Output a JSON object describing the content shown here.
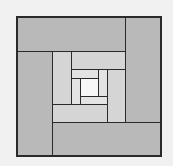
{
  "diagram": {
    "type": "log-cabin spiral of nested rectangles",
    "colors": {
      "background": "#f1f1f1",
      "stroke": "#2a2a2a",
      "ring_outer": "#b9b9b9",
      "ring_middle": "#d5d5d5",
      "ring_inner": "#e3e3e3",
      "center": "#f7f7f7"
    },
    "frame": {
      "x": 16,
      "y": 16,
      "w": 146,
      "h": 141
    },
    "rects": [
      {
        "name": "outer-top",
        "ring": "outer",
        "x": 16,
        "y": 16,
        "w": 110,
        "h": 36
      },
      {
        "name": "outer-right",
        "ring": "outer",
        "x": 125,
        "y": 16,
        "w": 37,
        "h": 107
      },
      {
        "name": "outer-bottom",
        "ring": "outer",
        "x": 52,
        "y": 122,
        "w": 110,
        "h": 35
      },
      {
        "name": "outer-left",
        "ring": "outer",
        "x": 16,
        "y": 51,
        "w": 37,
        "h": 106
      },
      {
        "name": "middle-left",
        "ring": "middle",
        "x": 52,
        "y": 51,
        "w": 20,
        "h": 54
      },
      {
        "name": "middle-top",
        "ring": "middle",
        "x": 71,
        "y": 51,
        "w": 55,
        "h": 19
      },
      {
        "name": "middle-right",
        "ring": "middle",
        "x": 107,
        "y": 69,
        "w": 19,
        "h": 54
      },
      {
        "name": "middle-bottom",
        "ring": "middle",
        "x": 52,
        "y": 104,
        "w": 56,
        "h": 19
      },
      {
        "name": "inner-top",
        "ring": "inner",
        "x": 71,
        "y": 69,
        "w": 28,
        "h": 10
      },
      {
        "name": "inner-right",
        "ring": "inner",
        "x": 98,
        "y": 69,
        "w": 10,
        "h": 28
      },
      {
        "name": "inner-bottom",
        "ring": "inner",
        "x": 80,
        "y": 96,
        "w": 28,
        "h": 9
      },
      {
        "name": "inner-left",
        "ring": "inner",
        "x": 71,
        "y": 78,
        "w": 10,
        "h": 27
      },
      {
        "name": "center-square",
        "ring": "center",
        "x": 80,
        "y": 78,
        "w": 19,
        "h": 19
      }
    ]
  }
}
